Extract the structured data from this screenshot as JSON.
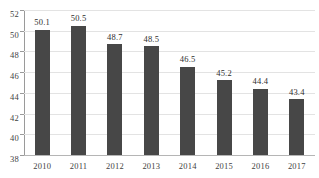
{
  "chart_data": {
    "type": "bar",
    "title": "",
    "subtitle": "",
    "xlabel": "",
    "ylabel": "",
    "categories": [
      "2010",
      "2011",
      "2012",
      "2013",
      "2014",
      "2015",
      "2016",
      "2017"
    ],
    "values": [
      50.1,
      50.5,
      48.7,
      48.5,
      46.5,
      45.2,
      44.4,
      43.4
    ],
    "data_labels": [
      "50.1",
      "50.5",
      "48.7",
      "48.5",
      "46.5",
      "45.2",
      "44.4",
      "43.4"
    ],
    "ylim": [
      38,
      52
    ],
    "yticks": [
      38,
      40,
      42,
      44,
      46,
      48,
      50,
      52
    ],
    "ytick_labels": [
      "38",
      "40",
      "42",
      "44",
      "46",
      "48",
      "50",
      "52"
    ],
    "grid": "horizontal",
    "legend": "none",
    "series": [
      {
        "name": "",
        "values": [
          50.1,
          50.5,
          48.7,
          48.5,
          46.5,
          45.2,
          44.4,
          43.4
        ],
        "color": "#474747"
      }
    ]
  },
  "colors": {
    "bar": "#474747",
    "gridline": "#e3e3e3",
    "axis": "#9a9a9a",
    "baseline": "#b5b5b5",
    "text": "#3f3f3f",
    "background": "#ffffff"
  }
}
